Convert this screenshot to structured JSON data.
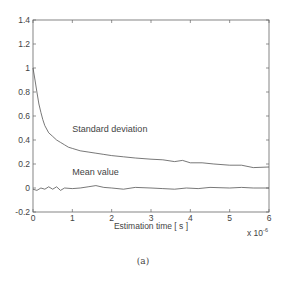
{
  "chart_data": {
    "type": "line",
    "title": "",
    "xlabel": "Estimation time [ s ]",
    "ylabel": "",
    "x_scale_note": "x 10^-6",
    "x_scale_base": "x 10",
    "x_scale_exp": "-6",
    "xlim": [
      0,
      6
    ],
    "ylim": [
      -0.2,
      1.4
    ],
    "xticks": [
      0,
      1,
      2,
      3,
      4,
      5,
      6
    ],
    "yticks": [
      -0.2,
      0,
      0.2,
      0.4,
      0.6,
      0.8,
      1,
      1.2,
      1.4
    ],
    "ytick_labels": [
      "-0.2",
      "0",
      "0.2",
      "0.4",
      "0.6",
      "0.8",
      "1",
      "1.2",
      "1.4"
    ],
    "xtick_labels": [
      "0",
      "1",
      "2",
      "3",
      "4",
      "5",
      "6"
    ],
    "grid": false,
    "legend": "none (inline annotations)",
    "series": [
      {
        "name": "Standard deviation",
        "x": [
          0,
          0.05,
          0.1,
          0.15,
          0.2,
          0.25,
          0.3,
          0.4,
          0.5,
          0.6,
          0.7,
          0.8,
          0.9,
          1.0,
          1.2,
          1.4,
          1.6,
          1.8,
          2.0,
          2.3,
          2.6,
          3.0,
          3.3,
          3.6,
          3.8,
          4.0,
          4.3,
          4.6,
          5.0,
          5.3,
          5.6,
          6.0
        ],
        "values": [
          1.0,
          0.9,
          0.8,
          0.7,
          0.63,
          0.57,
          0.52,
          0.46,
          0.43,
          0.4,
          0.38,
          0.36,
          0.34,
          0.33,
          0.31,
          0.3,
          0.29,
          0.28,
          0.27,
          0.26,
          0.25,
          0.24,
          0.235,
          0.22,
          0.23,
          0.21,
          0.21,
          0.2,
          0.19,
          0.19,
          0.17,
          0.175
        ]
      },
      {
        "name": "Mean value",
        "x": [
          0,
          0.1,
          0.2,
          0.3,
          0.4,
          0.5,
          0.6,
          0.7,
          0.8,
          1.0,
          1.2,
          1.4,
          1.6,
          1.8,
          2.0,
          2.3,
          2.6,
          3.0,
          3.3,
          3.6,
          3.9,
          4.2,
          4.5,
          5.0,
          5.3,
          5.6,
          6.0
        ],
        "values": [
          -0.01,
          -0.02,
          0.0,
          -0.01,
          0.01,
          -0.01,
          0.01,
          -0.02,
          0.0,
          -0.005,
          0.0,
          0.01,
          0.02,
          0.005,
          0.0,
          -0.01,
          0.005,
          0.0,
          -0.005,
          -0.01,
          0.0,
          -0.005,
          0.005,
          0.0,
          0.005,
          0.0,
          0.0
        ]
      }
    ],
    "annotations": [
      {
        "text": "Standard deviation",
        "x": 1.0,
        "y": 0.47
      },
      {
        "text": "Mean value",
        "x": 1.0,
        "y": 0.11
      }
    ]
  },
  "caption": "(a)",
  "colors": {
    "line": "#555555",
    "axis": "#666666",
    "text": "#444444"
  }
}
